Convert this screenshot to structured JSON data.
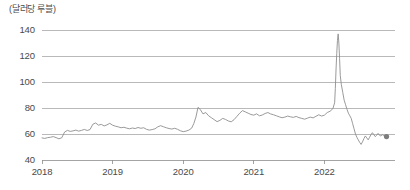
{
  "chart_data": {
    "type": "line",
    "title": "(달러당 루블)",
    "xlabel": "",
    "ylabel": "",
    "ylim": [
      40,
      140
    ],
    "xlim": [
      2018.0,
      2023.0
    ],
    "grid": true,
    "legend": false,
    "yticks": [
      40,
      60,
      80,
      100,
      120,
      140
    ],
    "ytick_labels": [
      "40",
      "60",
      "80",
      "100",
      "120",
      "140"
    ],
    "xticks": [
      2018,
      2019,
      2020,
      2021,
      2022
    ],
    "xtick_labels": [
      "2018",
      "2019",
      "2020",
      "2021",
      "2022"
    ],
    "line_color": "#8e8e8e",
    "end_marker": {
      "x": 2022.88,
      "y": 58.0,
      "color": "#7d7d7d"
    },
    "series": [
      {
        "name": "USD/RUB",
        "x": [
          2018.0,
          2018.04,
          2018.08,
          2018.12,
          2018.16,
          2018.2,
          2018.24,
          2018.28,
          2018.32,
          2018.36,
          2018.4,
          2018.44,
          2018.48,
          2018.52,
          2018.56,
          2018.6,
          2018.64,
          2018.68,
          2018.72,
          2018.76,
          2018.8,
          2018.84,
          2018.88,
          2018.92,
          2018.96,
          2019.0,
          2019.04,
          2019.08,
          2019.12,
          2019.16,
          2019.2,
          2019.24,
          2019.28,
          2019.32,
          2019.36,
          2019.4,
          2019.44,
          2019.48,
          2019.52,
          2019.56,
          2019.6,
          2019.64,
          2019.68,
          2019.72,
          2019.76,
          2019.8,
          2019.84,
          2019.88,
          2019.92,
          2019.96,
          2020.0,
          2020.04,
          2020.08,
          2020.12,
          2020.15,
          2020.18,
          2020.21,
          2020.24,
          2020.28,
          2020.32,
          2020.36,
          2020.4,
          2020.44,
          2020.48,
          2020.52,
          2020.56,
          2020.6,
          2020.64,
          2020.68,
          2020.72,
          2020.76,
          2020.8,
          2020.84,
          2020.88,
          2020.92,
          2020.96,
          2021.0,
          2021.04,
          2021.08,
          2021.12,
          2021.16,
          2021.2,
          2021.24,
          2021.28,
          2021.32,
          2021.36,
          2021.4,
          2021.44,
          2021.48,
          2021.52,
          2021.56,
          2021.6,
          2021.64,
          2021.68,
          2021.72,
          2021.76,
          2021.8,
          2021.84,
          2021.88,
          2021.92,
          2021.96,
          2022.0,
          2022.04,
          2022.08,
          2022.12,
          2022.145,
          2022.155,
          2022.165,
          2022.175,
          2022.185,
          2022.195,
          2022.205,
          2022.215,
          2022.225,
          2022.24,
          2022.26,
          2022.28,
          2022.3,
          2022.32,
          2022.34,
          2022.36,
          2022.38,
          2022.4,
          2022.42,
          2022.44,
          2022.46,
          2022.48,
          2022.5,
          2022.52,
          2022.54,
          2022.56,
          2022.58,
          2022.6,
          2022.62,
          2022.64,
          2022.66,
          2022.68,
          2022.7,
          2022.72,
          2022.74,
          2022.76,
          2022.78,
          2022.8,
          2022.82,
          2022.84,
          2022.86,
          2022.88
        ],
        "y": [
          57.0,
          56.6,
          57.2,
          57.5,
          58.0,
          57.2,
          56.3,
          57.1,
          61.5,
          62.8,
          62.0,
          62.4,
          63.0,
          62.2,
          62.8,
          63.5,
          62.7,
          63.4,
          67.5,
          68.5,
          66.8,
          67.4,
          66.2,
          67.0,
          68.2,
          66.8,
          66.0,
          65.5,
          64.8,
          65.2,
          64.5,
          64.0,
          64.6,
          64.2,
          65.0,
          64.4,
          64.8,
          63.6,
          63.0,
          63.4,
          64.0,
          65.5,
          66.4,
          65.6,
          64.8,
          64.2,
          63.8,
          64.4,
          63.6,
          62.5,
          61.8,
          62.2,
          63.0,
          64.5,
          68.0,
          73.0,
          80.5,
          79.0,
          75.5,
          76.5,
          74.0,
          72.5,
          71.0,
          69.5,
          70.5,
          72.0,
          71.2,
          70.0,
          69.4,
          71.0,
          73.5,
          76.0,
          78.0,
          77.0,
          76.0,
          75.0,
          74.5,
          75.5,
          74.0,
          74.6,
          75.8,
          76.5,
          75.4,
          74.8,
          74.0,
          73.2,
          72.5,
          73.0,
          73.8,
          73.2,
          72.8,
          73.5,
          72.6,
          72.0,
          71.4,
          72.2,
          73.0,
          72.4,
          73.6,
          74.8,
          73.8,
          74.5,
          76.5,
          77.5,
          79.5,
          84.0,
          95.0,
          110.0,
          122.0,
          132.0,
          137.0,
          130.0,
          118.0,
          105.0,
          98.0,
          92.0,
          86.0,
          82.5,
          79.0,
          76.0,
          74.0,
          72.0,
          68.0,
          64.0,
          60.0,
          57.5,
          55.5,
          53.5,
          52.0,
          54.0,
          56.5,
          58.5,
          57.0,
          55.5,
          57.5,
          59.5,
          61.0,
          59.5,
          58.0,
          59.0,
          60.5,
          59.0,
          58.5,
          59.5,
          58.8,
          58.2,
          58.0
        ]
      }
    ]
  }
}
